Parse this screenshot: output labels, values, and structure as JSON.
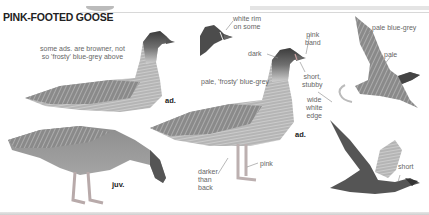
{
  "plate": {
    "title": "PINK-FOOTED GOOSE",
    "annotations": {
      "some_browner": "some ads. are browner, not\nso 'frosty' blue-grey above",
      "white_rim": "white rim\non some",
      "dark": "dark",
      "pink_band": "pink\nband",
      "pale_frosty": "pale, 'frosty' blue-grey",
      "short_stubby": "short,\nstubby",
      "wide_white_edge": "wide\nwhite\nedge",
      "pale_blue_grey": "pale blue-grey",
      "pale": "pale",
      "darker_than_back": "darker\nthan\nback",
      "pink": "pink",
      "short": "short"
    },
    "ages": {
      "adult_left": "ad.",
      "adult_center": "ad.",
      "juvenile": "juv."
    },
    "colors": {
      "title": "#222222",
      "annotation": "#666666",
      "leader": "#888888",
      "goose_body": "#9a9a9a",
      "goose_head": "#4a4a4a",
      "pink_accent": "#c9a0a0"
    }
  }
}
